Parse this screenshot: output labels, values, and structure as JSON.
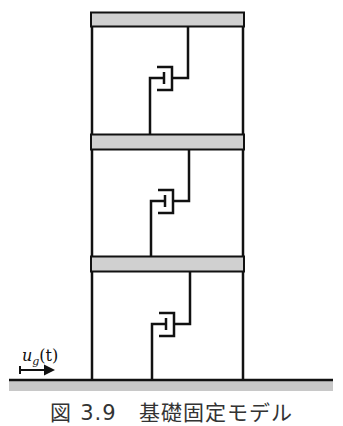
{
  "figure": {
    "caption": "図 3.9　基礎固定モデル",
    "input_label": {
      "symbol": "u",
      "subscript": "g",
      "argument": "(t)"
    },
    "stories": 3,
    "components": {
      "slab": "floor-slab",
      "column": "column",
      "damper": "damper-brace",
      "ground": "ground",
      "arrow": "ground-motion-arrow"
    },
    "colors": {
      "line": "#111111",
      "slab_fill": "#d0d0d0",
      "ground_fill": "#c8c8c8",
      "caption": "#333333"
    }
  }
}
